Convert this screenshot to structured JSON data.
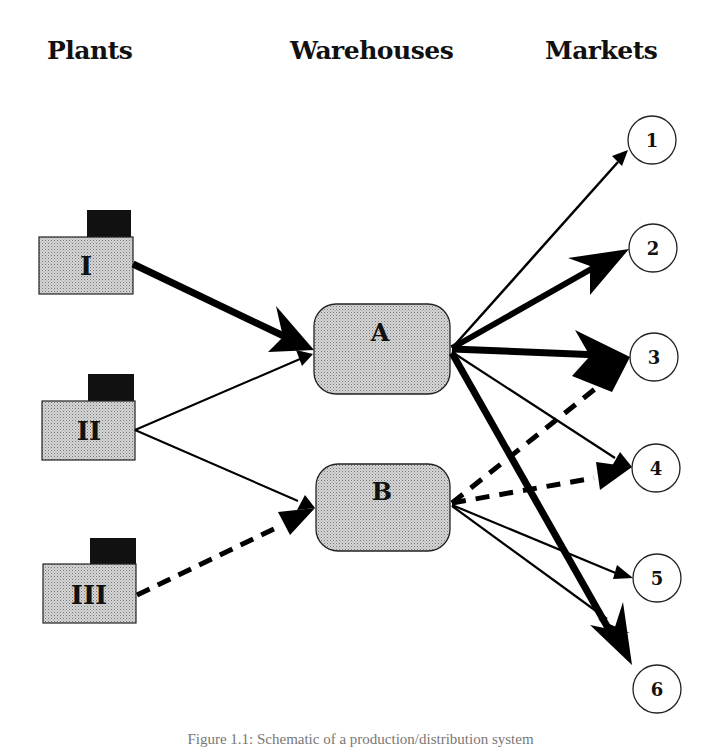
{
  "headers": {
    "plants": "Plants",
    "warehouses": "Warehouses",
    "markets": "Markets"
  },
  "plants": [
    {
      "id": "I",
      "label": "I"
    },
    {
      "id": "II",
      "label": "II"
    },
    {
      "id": "III",
      "label": "III"
    }
  ],
  "warehouses": [
    {
      "id": "A",
      "label": "A"
    },
    {
      "id": "B",
      "label": "B"
    }
  ],
  "markets": [
    {
      "id": "1",
      "label": "1"
    },
    {
      "id": "2",
      "label": "2"
    },
    {
      "id": "3",
      "label": "3"
    },
    {
      "id": "4",
      "label": "4"
    },
    {
      "id": "5",
      "label": "5"
    },
    {
      "id": "6",
      "label": "6"
    }
  ],
  "flows": [
    {
      "from": "I",
      "to": "A",
      "style": "thick"
    },
    {
      "from": "II",
      "to": "A",
      "style": "thin"
    },
    {
      "from": "II",
      "to": "B",
      "style": "thin"
    },
    {
      "from": "III",
      "to": "B",
      "style": "dashed"
    },
    {
      "from": "A",
      "to": "1",
      "style": "thin"
    },
    {
      "from": "A",
      "to": "2",
      "style": "thick"
    },
    {
      "from": "A",
      "to": "3",
      "style": "thick"
    },
    {
      "from": "A",
      "to": "4",
      "style": "thin"
    },
    {
      "from": "A",
      "to": "6",
      "style": "thick"
    },
    {
      "from": "B",
      "to": "3",
      "style": "dashed"
    },
    {
      "from": "B",
      "to": "4",
      "style": "dashed"
    },
    {
      "from": "B",
      "to": "5",
      "style": "thin"
    },
    {
      "from": "B",
      "to": "6",
      "style": "thin"
    }
  ],
  "caption": "Figure 1.1: Schematic of a production/distribution system",
  "colors": {
    "fill_gray": "#c8c8c8",
    "chimney": "#111111",
    "line": "#000000"
  }
}
